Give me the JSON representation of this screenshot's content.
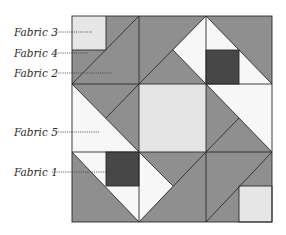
{
  "diagram": {
    "type": "quilt-block",
    "grid": "3x3",
    "colors": {
      "fabric1": "#474747",
      "fabric2": "#8f8f8f",
      "fabric3": "#e6e6e6",
      "fabric4": "#8f8f8f",
      "fabric5": "#f7f7f7",
      "center": "#e4e4e4",
      "outline": "#2b2b2b"
    },
    "labels": [
      {
        "id": "fabric3",
        "text": "Fabric 3"
      },
      {
        "id": "fabric4",
        "text": "Fabric 4"
      },
      {
        "id": "fabric2",
        "text": "Fabric 2"
      },
      {
        "id": "fabric5",
        "text": "Fabric 5"
      },
      {
        "id": "fabric1",
        "text": "Fabric 1"
      }
    ]
  }
}
